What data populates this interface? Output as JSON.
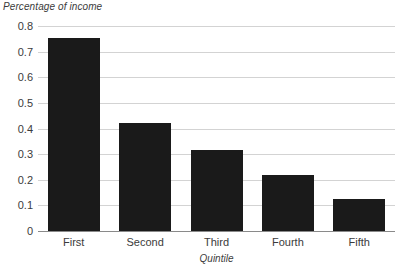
{
  "chart_data": {
    "type": "bar",
    "title": "",
    "categories": [
      "First",
      "Second",
      "Third",
      "Fourth",
      "Fifth"
    ],
    "values": [
      0.755,
      0.42,
      0.315,
      0.22,
      0.125
    ],
    "xlabel": "Quintile",
    "ylabel": "Percentage of income",
    "ylim": [
      0,
      0.8
    ],
    "ytick_labels": [
      "0.8",
      "0.7",
      "0.6",
      "0.5",
      "0.4",
      "0.3",
      "0.2",
      "0.1",
      "0"
    ],
    "ytick_values": [
      0.8,
      0.7,
      0.6,
      0.5,
      0.4,
      0.3,
      0.2,
      0.1,
      0
    ],
    "grid": true,
    "legend": "none",
    "colors": {
      "bar": "#1a1a1a",
      "gridline": "#d3d3d3",
      "axis": "#8a8a8a",
      "text": "#3b3b3b",
      "background": "#ffffff"
    }
  }
}
